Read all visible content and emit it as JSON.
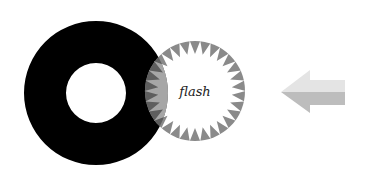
{
  "diagram": {
    "ring": {
      "cx": 96,
      "cy": 93,
      "r_outer": 72,
      "r_inner": 30,
      "color": "#000000"
    },
    "starburst": {
      "cx": 195,
      "cy": 91,
      "r": 50,
      "inner_r": 37,
      "points": 30,
      "spike_color": "#8a8a8a",
      "overlap_fill": "#a6a6a6",
      "label": "flash"
    },
    "arrow": {
      "direction": "left",
      "light_color": "#e4e4e4",
      "dark_color": "#bdbdbd"
    }
  }
}
